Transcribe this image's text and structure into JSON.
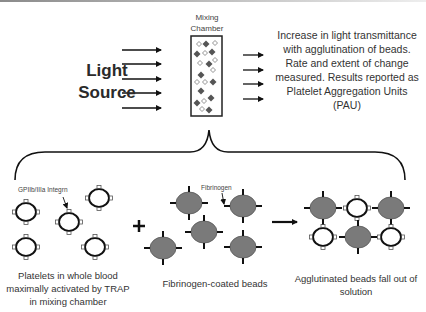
{
  "diagram": {
    "light_source_label_line1": "Light",
    "light_source_label_line2": "Source",
    "mixing_chamber_label_line1": "Mixing",
    "mixing_chamber_label_line2": "Chamber",
    "result_text": "Increase in light transmittance with agglutination of beads. Rate and extent of change measured. Results reported as Platelet Aggregation Units (PAU)",
    "integrin_label": "GPIIb/IIIa Integrn",
    "fibrinogen_label": "Fibrinogen",
    "operator_plus": "+",
    "panels": [
      {
        "caption": "Platelets in whole blood maximally activated by TRAP in mixing chamber"
      },
      {
        "caption": "Fibrinogen-coated beads"
      },
      {
        "caption": "Agglutinated beads fall out of solution"
      }
    ],
    "colors": {
      "bead_fill": "#7a7a7a",
      "platelet_fill": "#ffffff",
      "stroke": "#111111",
      "text": "#333333"
    },
    "incoming_arrow_count": 5,
    "outgoing_arrow_count": 4
  }
}
